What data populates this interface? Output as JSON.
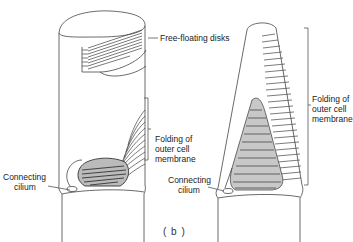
{
  "figure": {
    "caption": "( b )",
    "left_diagram": {
      "name": "rod outer segment",
      "labels": {
        "disks": "Free-floating disks",
        "folding_line1": "Folding of",
        "folding_line2": "outer cell",
        "folding_line3": "membrane",
        "cilium_line1": "Connecting",
        "cilium_line2": "cilium"
      }
    },
    "right_diagram": {
      "name": "cone outer segment",
      "labels": {
        "folding_line1": "Folding of",
        "folding_line2": "outer cell",
        "folding_line3": "membrane",
        "cilium_line1": "Connecting",
        "cilium_line2": "cilium"
      }
    },
    "colors": {
      "ink": "#333333",
      "shade": "#555555",
      "paper": "#ffffff"
    }
  }
}
